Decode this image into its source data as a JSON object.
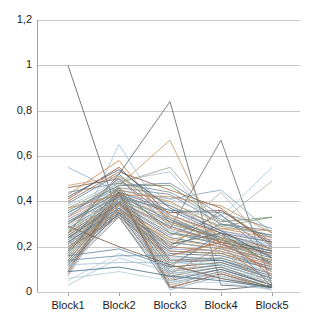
{
  "chart_data": {
    "type": "line",
    "subtype": "parallel-coordinates",
    "title": "",
    "xlabel": "",
    "ylabel": "",
    "categories": [
      "Block1",
      "Block2",
      "Block3",
      "Block4",
      "Block5"
    ],
    "ylim": [
      0,
      1.2
    ],
    "ytick_values": [
      0,
      0.2,
      0.4,
      0.6,
      0.8,
      1,
      1.2
    ],
    "ytick_labels": [
      "0",
      "0,2",
      "0,4",
      "0,6",
      "0,8",
      "1",
      "1,2"
    ],
    "decimal_separator": ",",
    "grid": "horizontal",
    "legend": "none",
    "series_count": 84,
    "colors": {
      "grid": "#c8c8c8",
      "axis": "#a0a0a0",
      "text": "#1a1a1a",
      "background": "#ffffff",
      "palette": [
        "#5b7f9e",
        "#b5623a",
        "#9aa58c",
        "#7e7e8c",
        "#8aa6bd",
        "#c08a5c",
        "#6f8f6a",
        "#a38fa0",
        "#4f6f88",
        "#8f5a3c",
        "#9fb0c4",
        "#c9a06a",
        "#6a8d9e",
        "#7a6f5e",
        "#a8b8a0",
        "#5e6b7a",
        "#bf7f4f",
        "#93a7b8",
        "#6b7b6b",
        "#8c8fa3",
        "#4a5f73",
        "#d0a582",
        "#7f9fb5",
        "#a5937f",
        "#616d61",
        "#b07050",
        "#8fa8c0",
        "#737373",
        "#9e8a6d",
        "#567089"
      ]
    },
    "series": [
      {
        "name": "s1",
        "values": [
          1.0,
          0.33,
          0.02,
          0.01,
          0.03
        ],
        "color": "#5a5f66",
        "width": 0.9
      },
      {
        "name": "s2",
        "values": [
          0.26,
          0.52,
          0.84,
          0.03,
          0.02
        ],
        "color": "#5f656c",
        "width": 0.9
      },
      {
        "name": "s3",
        "values": [
          0.21,
          0.47,
          0.67,
          0.2,
          0.14
        ],
        "color": "#c09a62",
        "width": 0.9
      },
      {
        "name": "s4",
        "values": [
          0.23,
          0.44,
          0.28,
          0.67,
          0.03
        ],
        "color": "#6b7078",
        "width": 0.9
      },
      {
        "name": "s5",
        "values": [
          0.18,
          0.65,
          0.3,
          0.24,
          0.2
        ],
        "color": "#9ec1d4",
        "width": 0.9
      },
      {
        "name": "s6",
        "values": [
          0.55,
          0.44,
          0.31,
          0.25,
          0.21
        ],
        "color": "#8fb3c9",
        "width": 0.9
      },
      {
        "name": "s7",
        "values": [
          0.46,
          0.5,
          0.32,
          0.22,
          0.17
        ],
        "color": "#7a5a48",
        "width": 0.9
      },
      {
        "name": "s8",
        "values": [
          0.43,
          0.58,
          0.3,
          0.24,
          0.16
        ],
        "color": "#c98a52",
        "width": 0.9
      },
      {
        "name": "s9",
        "values": [
          0.41,
          0.55,
          0.34,
          0.26,
          0.19
        ],
        "color": "#8a4f34",
        "width": 0.9
      },
      {
        "name": "s10",
        "values": [
          0.39,
          0.52,
          0.33,
          0.23,
          0.18
        ],
        "color": "#5b7f9e",
        "width": 0.9
      },
      {
        "name": "s11",
        "values": [
          0.38,
          0.49,
          0.53,
          0.27,
          0.22
        ],
        "color": "#aebfcc",
        "width": 0.9
      },
      {
        "name": "s12",
        "values": [
          0.37,
          0.48,
          0.55,
          0.29,
          0.25
        ],
        "color": "#9aa58c",
        "width": 0.9
      },
      {
        "name": "s13",
        "values": [
          0.36,
          0.47,
          0.47,
          0.31,
          0.33
        ],
        "color": "#6f8f6a",
        "width": 0.9
      },
      {
        "name": "s14",
        "values": [
          0.35,
          0.46,
          0.43,
          0.3,
          0.27
        ],
        "color": "#7e7e8c",
        "width": 0.9
      },
      {
        "name": "s15",
        "values": [
          0.34,
          0.45,
          0.41,
          0.45,
          0.26
        ],
        "color": "#8aa6bd",
        "width": 0.9
      },
      {
        "name": "s16",
        "values": [
          0.33,
          0.45,
          0.4,
          0.28,
          0.24
        ],
        "color": "#c08a5c",
        "width": 0.9
      },
      {
        "name": "s17",
        "values": [
          0.32,
          0.44,
          0.38,
          0.27,
          0.23
        ],
        "color": "#a38fa0",
        "width": 0.9
      },
      {
        "name": "s18",
        "values": [
          0.31,
          0.44,
          0.36,
          0.26,
          0.22
        ],
        "color": "#4f6f88",
        "width": 0.9
      },
      {
        "name": "s19",
        "values": [
          0.3,
          0.43,
          0.35,
          0.36,
          0.21
        ],
        "color": "#8f5a3c",
        "width": 0.9
      },
      {
        "name": "s20",
        "values": [
          0.29,
          0.43,
          0.34,
          0.25,
          0.2
        ],
        "color": "#9fb0c4",
        "width": 0.9
      },
      {
        "name": "s21",
        "values": [
          0.28,
          0.42,
          0.33,
          0.24,
          0.19
        ],
        "color": "#c9a06a",
        "width": 0.9
      },
      {
        "name": "s22",
        "values": [
          0.28,
          0.42,
          0.32,
          0.24,
          0.18
        ],
        "color": "#6a8d9e",
        "width": 0.9
      },
      {
        "name": "s23",
        "values": [
          0.27,
          0.41,
          0.31,
          0.23,
          0.18
        ],
        "color": "#7a6f5e",
        "width": 0.9
      },
      {
        "name": "s24",
        "values": [
          0.27,
          0.41,
          0.3,
          0.23,
          0.17
        ],
        "color": "#a8b8a0",
        "width": 0.9
      },
      {
        "name": "s25",
        "values": [
          0.26,
          0.4,
          0.29,
          0.22,
          0.17
        ],
        "color": "#5e6b7a",
        "width": 0.9
      },
      {
        "name": "s26",
        "values": [
          0.26,
          0.4,
          0.28,
          0.22,
          0.16
        ],
        "color": "#bf7f4f",
        "width": 0.9
      },
      {
        "name": "s27",
        "values": [
          0.25,
          0.4,
          0.27,
          0.21,
          0.16
        ],
        "color": "#93a7b8",
        "width": 0.9
      },
      {
        "name": "s28",
        "values": [
          0.25,
          0.39,
          0.26,
          0.21,
          0.15
        ],
        "color": "#6b7b6b",
        "width": 0.9
      },
      {
        "name": "s29",
        "values": [
          0.24,
          0.39,
          0.25,
          0.34,
          0.15
        ],
        "color": "#8c8fa3",
        "width": 0.9
      },
      {
        "name": "s30",
        "values": [
          0.24,
          0.38,
          0.24,
          0.2,
          0.14
        ],
        "color": "#4a5f73",
        "width": 0.9
      },
      {
        "name": "s31",
        "values": [
          0.23,
          0.38,
          0.23,
          0.2,
          0.14
        ],
        "color": "#d0a582",
        "width": 0.9
      },
      {
        "name": "s32",
        "values": [
          0.23,
          0.37,
          0.22,
          0.19,
          0.13
        ],
        "color": "#7f9fb5",
        "width": 0.9
      },
      {
        "name": "s33",
        "values": [
          0.22,
          0.37,
          0.22,
          0.19,
          0.13
        ],
        "color": "#a5937f",
        "width": 0.9
      },
      {
        "name": "s34",
        "values": [
          0.22,
          0.36,
          0.21,
          0.26,
          0.12
        ],
        "color": "#616d61",
        "width": 0.9
      },
      {
        "name": "s35",
        "values": [
          0.21,
          0.36,
          0.2,
          0.18,
          0.12
        ],
        "color": "#b07050",
        "width": 0.9
      },
      {
        "name": "s36",
        "values": [
          0.21,
          0.35,
          0.19,
          0.18,
          0.11
        ],
        "color": "#8fa8c0",
        "width": 0.9
      },
      {
        "name": "s37",
        "values": [
          0.2,
          0.35,
          0.18,
          0.17,
          0.11
        ],
        "color": "#737373",
        "width": 0.9
      },
      {
        "name": "s38",
        "values": [
          0.2,
          0.34,
          0.18,
          0.17,
          0.1
        ],
        "color": "#9e8a6d",
        "width": 0.9
      },
      {
        "name": "s39",
        "values": [
          0.19,
          0.34,
          0.17,
          0.16,
          0.1
        ],
        "color": "#567089",
        "width": 0.9
      },
      {
        "name": "s40",
        "values": [
          0.19,
          0.33,
          0.16,
          0.22,
          0.09
        ],
        "color": "#b5623a",
        "width": 0.9
      },
      {
        "name": "s41",
        "values": [
          0.18,
          0.33,
          0.15,
          0.15,
          0.09
        ],
        "color": "#aab9c9",
        "width": 0.9
      },
      {
        "name": "s42",
        "values": [
          0.18,
          0.46,
          0.14,
          0.15,
          0.08
        ],
        "color": "#6d8470",
        "width": 0.9
      },
      {
        "name": "s43",
        "values": [
          0.17,
          0.45,
          0.14,
          0.14,
          0.08
        ],
        "color": "#95889b",
        "width": 0.9
      },
      {
        "name": "s44",
        "values": [
          0.17,
          0.44,
          0.13,
          0.14,
          0.07
        ],
        "color": "#4e6a80",
        "width": 0.9
      },
      {
        "name": "s45",
        "values": [
          0.16,
          0.43,
          0.12,
          0.24,
          0.07
        ],
        "color": "#c2854e",
        "width": 0.9
      },
      {
        "name": "s46",
        "values": [
          0.16,
          0.42,
          0.11,
          0.13,
          0.06
        ],
        "color": "#8ba3ae",
        "width": 0.9
      },
      {
        "name": "s47",
        "values": [
          0.15,
          0.41,
          0.11,
          0.13,
          0.06
        ],
        "color": "#7c7263",
        "width": 0.9
      },
      {
        "name": "s48",
        "values": [
          0.15,
          0.4,
          0.1,
          0.12,
          0.05
        ],
        "color": "#a3b3a8",
        "width": 0.9
      },
      {
        "name": "s49",
        "values": [
          0.14,
          0.4,
          0.09,
          0.12,
          0.05
        ],
        "color": "#5c6a78",
        "width": 0.9
      },
      {
        "name": "s50",
        "values": [
          0.14,
          0.39,
          0.08,
          0.2,
          0.04
        ],
        "color": "#bd8257",
        "width": 0.9
      },
      {
        "name": "s51",
        "values": [
          0.13,
          0.38,
          0.08,
          0.11,
          0.04
        ],
        "color": "#90a6bb",
        "width": 0.9
      },
      {
        "name": "s52",
        "values": [
          0.13,
          0.37,
          0.07,
          0.11,
          0.03
        ],
        "color": "#6b7d6b",
        "width": 0.9
      },
      {
        "name": "s53",
        "values": [
          0.12,
          0.36,
          0.06,
          0.1,
          0.03
        ],
        "color": "#8a8da0",
        "width": 0.9
      },
      {
        "name": "s54",
        "values": [
          0.12,
          0.35,
          0.05,
          0.1,
          0.03
        ],
        "color": "#4c6175",
        "width": 0.9
      },
      {
        "name": "s55",
        "values": [
          0.11,
          0.34,
          0.05,
          0.18,
          0.02
        ],
        "color": "#cfa47f",
        "width": 0.9
      },
      {
        "name": "s56",
        "values": [
          0.11,
          0.33,
          0.04,
          0.09,
          0.02
        ],
        "color": "#7d9db3",
        "width": 0.9
      },
      {
        "name": "s57",
        "values": [
          0.1,
          0.45,
          0.03,
          0.09,
          0.02
        ],
        "color": "#a3917d",
        "width": 0.9
      },
      {
        "name": "s58",
        "values": [
          0.09,
          0.44,
          0.02,
          0.08,
          0.02
        ],
        "color": "#5f6b5f",
        "width": 0.9
      },
      {
        "name": "s59",
        "values": [
          0.08,
          0.43,
          0.02,
          0.08,
          0.01
        ],
        "color": "#ae6e4e",
        "width": 0.9
      },
      {
        "name": "s60",
        "values": [
          0.07,
          0.42,
          0.01,
          0.07,
          0.01
        ],
        "color": "#8da6be",
        "width": 0.9
      },
      {
        "name": "s61",
        "values": [
          0.05,
          0.17,
          0.1,
          0.07,
          0.01
        ],
        "color": "#b8cfdd",
        "width": 0.9
      },
      {
        "name": "s62",
        "values": [
          0.03,
          0.15,
          0.09,
          0.06,
          0.01
        ],
        "color": "#a8c6d8",
        "width": 0.9
      },
      {
        "name": "s63",
        "values": [
          0.29,
          0.2,
          0.12,
          0.06,
          0.02
        ],
        "color": "#7d5a44",
        "width": 0.9
      },
      {
        "name": "s64",
        "values": [
          0.16,
          0.19,
          0.11,
          0.26,
          0.02
        ],
        "color": "#5d87a3",
        "width": 0.9
      },
      {
        "name": "s65",
        "values": [
          0.17,
          0.49,
          0.39,
          0.31,
          0.49
        ],
        "color": "#aab8a2",
        "width": 0.9
      },
      {
        "name": "s66",
        "values": [
          0.21,
          0.5,
          0.41,
          0.33,
          0.55
        ],
        "color": "#a9cbd9",
        "width": 0.9
      },
      {
        "name": "s67",
        "values": [
          0.26,
          0.51,
          0.38,
          0.29,
          0.33
        ],
        "color": "#8c9f7f",
        "width": 0.9
      },
      {
        "name": "s68",
        "values": [
          0.31,
          0.42,
          0.36,
          0.35,
          0.28
        ],
        "color": "#6d94aa",
        "width": 0.9
      },
      {
        "name": "s69",
        "values": [
          0.37,
          0.43,
          0.42,
          0.38,
          0.26
        ],
        "color": "#b98a5e",
        "width": 0.9
      },
      {
        "name": "s70",
        "values": [
          0.44,
          0.48,
          0.44,
          0.32,
          0.24
        ],
        "color": "#7b8a96",
        "width": 0.9
      },
      {
        "name": "s71",
        "values": [
          0.4,
          0.53,
          0.45,
          0.37,
          0.2
        ],
        "color": "#9d6a47",
        "width": 0.9
      },
      {
        "name": "s72",
        "values": [
          0.35,
          0.47,
          0.48,
          0.34,
          0.18
        ],
        "color": "#6f87a0",
        "width": 0.9
      },
      {
        "name": "s73",
        "values": [
          0.27,
          0.41,
          0.24,
          0.44,
          0.19
        ],
        "color": "#a6b5bd",
        "width": 0.9
      },
      {
        "name": "s74",
        "values": [
          0.24,
          0.39,
          0.2,
          0.36,
          0.22
        ],
        "color": "#89745f",
        "width": 0.9
      },
      {
        "name": "s75",
        "values": [
          0.22,
          0.37,
          0.19,
          0.3,
          0.25
        ],
        "color": "#5e7f96",
        "width": 0.9
      },
      {
        "name": "s76",
        "values": [
          0.19,
          0.36,
          0.23,
          0.28,
          0.27
        ],
        "color": "#c49a6c",
        "width": 0.9
      },
      {
        "name": "s77",
        "values": [
          0.3,
          0.46,
          0.26,
          0.23,
          0.13
        ],
        "color": "#758a75",
        "width": 0.9
      },
      {
        "name": "s78",
        "values": [
          0.33,
          0.5,
          0.29,
          0.21,
          0.12
        ],
        "color": "#96879c",
        "width": 0.9
      },
      {
        "name": "s79",
        "values": [
          0.42,
          0.54,
          0.37,
          0.27,
          0.15
        ],
        "color": "#45607a",
        "width": 0.9
      },
      {
        "name": "s80",
        "values": [
          0.47,
          0.51,
          0.34,
          0.25,
          0.11
        ],
        "color": "#cc9f78",
        "width": 0.9
      },
      {
        "name": "s81",
        "values": [
          0.12,
          0.13,
          0.13,
          0.12,
          0.05
        ],
        "color": "#9fc3d5",
        "width": 0.9
      },
      {
        "name": "s82",
        "values": [
          0.14,
          0.16,
          0.16,
          0.14,
          0.06
        ],
        "color": "#6a93aa",
        "width": 0.9
      },
      {
        "name": "s83",
        "values": [
          0.09,
          0.11,
          0.07,
          0.05,
          0.02
        ],
        "color": "#437089",
        "width": 0.9
      },
      {
        "name": "s84",
        "values": [
          0.06,
          0.09,
          0.05,
          0.04,
          0.01
        ],
        "color": "#b2cddb",
        "width": 0.9
      }
    ]
  },
  "axes": {
    "y_axis_name": "value-axis",
    "x_axis_name": "block-axis"
  }
}
